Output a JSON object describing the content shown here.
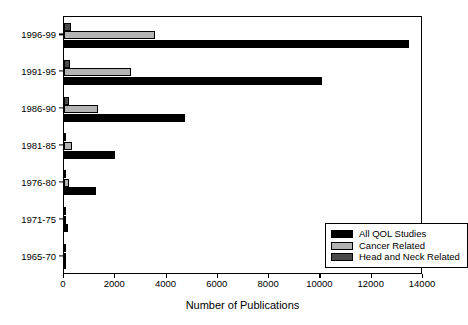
{
  "chart_data": {
    "type": "bar",
    "orientation": "horizontal",
    "title": "",
    "xlabel": "Number of Publications",
    "ylabel": "",
    "xlim": [
      0,
      14000
    ],
    "xticks": [
      0,
      2000,
      4000,
      6000,
      8000,
      10000,
      12000,
      14000
    ],
    "xtick_labels": [
      "0",
      "2000",
      "4000",
      "6000",
      "8000",
      "10000",
      "12000",
      "14000"
    ],
    "grid": false,
    "legend_position": "lower right",
    "categories": [
      "1996-99",
      "1991-95",
      "1986-90",
      "1981-85",
      "1976-80",
      "1971-75",
      "1965-70"
    ],
    "series": [
      {
        "name": "All QOL Studies",
        "color": "#000000",
        "values": [
          13450,
          10050,
          4700,
          1990,
          1250,
          155,
          25
        ]
      },
      {
        "name": "Cancer Related",
        "color": "#b3b3b3",
        "values": [
          3530,
          2630,
          1310,
          330,
          190,
          20,
          10
        ]
      },
      {
        "name": "Head and Neck Related",
        "color": "#4a4a4a",
        "values": [
          290,
          250,
          180,
          45,
          30,
          8,
          4
        ]
      }
    ]
  },
  "legend": {
    "entries": [
      {
        "label": "All QOL Studies",
        "color": "#000000"
      },
      {
        "label": "Cancer Related",
        "color": "#b3b3b3"
      },
      {
        "label": "Head and Neck Related",
        "color": "#4a4a4a"
      }
    ]
  },
  "axis": {
    "x_title": "Number of Publications"
  }
}
